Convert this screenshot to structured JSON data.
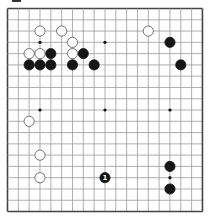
{
  "board": {
    "size": 19,
    "origin_x": 7.5,
    "origin_y": 8.5,
    "spacing_x": 10.83,
    "spacing_y": 11.28,
    "line_color": "#9a9a9a",
    "frame_color": "#444444",
    "star_points": [
      [
        3,
        3
      ],
      [
        9,
        3
      ],
      [
        15,
        3
      ],
      [
        3,
        9
      ],
      [
        9,
        9
      ],
      [
        15,
        9
      ],
      [
        3,
        15
      ],
      [
        9,
        15
      ],
      [
        15,
        15
      ]
    ],
    "stones": [
      {
        "color": "white",
        "col": 3,
        "row": 2
      },
      {
        "color": "white",
        "col": 5,
        "row": 2
      },
      {
        "color": "white",
        "col": 6,
        "row": 3
      },
      {
        "color": "white",
        "col": 2,
        "row": 4
      },
      {
        "color": "white",
        "col": 3,
        "row": 4
      },
      {
        "color": "black",
        "col": 4,
        "row": 4
      },
      {
        "color": "white",
        "col": 6,
        "row": 4
      },
      {
        "color": "black",
        "col": 7,
        "row": 4
      },
      {
        "color": "black",
        "col": 2,
        "row": 5
      },
      {
        "color": "black",
        "col": 3,
        "row": 5
      },
      {
        "color": "black",
        "col": 4,
        "row": 5
      },
      {
        "color": "black",
        "col": 6,
        "row": 5
      },
      {
        "color": "black",
        "col": 8,
        "row": 5
      },
      {
        "color": "white",
        "col": 13,
        "row": 2
      },
      {
        "color": "black",
        "col": 15,
        "row": 3
      },
      {
        "color": "black",
        "col": 16,
        "row": 5
      },
      {
        "color": "white",
        "col": 2,
        "row": 10
      },
      {
        "color": "white",
        "col": 3,
        "row": 13
      },
      {
        "color": "white",
        "col": 3,
        "row": 15
      },
      {
        "color": "black",
        "col": 9,
        "row": 15,
        "label": "1"
      },
      {
        "color": "black",
        "col": 15,
        "row": 14
      },
      {
        "color": "black",
        "col": 15,
        "row": 16
      }
    ]
  }
}
